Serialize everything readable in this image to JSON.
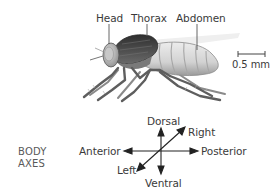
{
  "figure": {
    "labels": {
      "head": "Head",
      "thorax": "Thorax",
      "abdomen": "Abdomen"
    },
    "scale_bar": {
      "label": "0.5 mm"
    }
  },
  "body_axes": {
    "title_line1": "BODY",
    "title_line2": "AXES",
    "dorsal": "Dorsal",
    "ventral": "Ventral",
    "anterior": "Anterior",
    "posterior": "Posterior",
    "left": "Left",
    "right": "Right"
  },
  "colors": {
    "text": "#3a3a3a",
    "arrow": "#222222",
    "thorax": "#4a4a4a",
    "abdomen": "#d6d6d6",
    "legs": "#6e6e6e"
  }
}
